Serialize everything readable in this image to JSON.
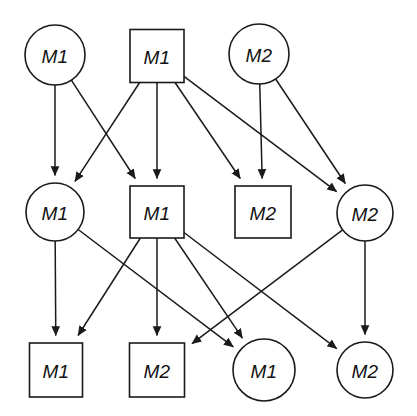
{
  "diagram": {
    "background_color": "#ffffff",
    "stroke_color": "#1a1a1a",
    "fill_color": "#ffffff",
    "width": 417,
    "height": 416,
    "rows": 3,
    "columns": 4,
    "node_shapes": [
      "circle",
      "square"
    ],
    "nodes": [
      {
        "id": "n1",
        "label": "M1",
        "shape": "circle",
        "row": 0,
        "col": 0,
        "cx": 55,
        "cy": 55,
        "r": 30
      },
      {
        "id": "n2",
        "label": "M1",
        "shape": "square",
        "row": 0,
        "col": 1,
        "cx": 157,
        "cy": 56,
        "w": 54,
        "h": 53
      },
      {
        "id": "n3",
        "label": "M2",
        "shape": "circle",
        "row": 0,
        "col": 2,
        "cx": 259,
        "cy": 54,
        "r": 30
      },
      {
        "id": "n4",
        "label": "M1",
        "shape": "circle",
        "row": 1,
        "col": 0,
        "cx": 55,
        "cy": 212,
        "r": 29
      },
      {
        "id": "n5",
        "label": "M1",
        "shape": "square",
        "row": 1,
        "col": 1,
        "cx": 157,
        "cy": 212,
        "w": 54,
        "h": 52
      },
      {
        "id": "n6",
        "label": "M2",
        "shape": "square",
        "row": 1,
        "col": 2,
        "cx": 263,
        "cy": 212,
        "w": 56,
        "h": 52
      },
      {
        "id": "n7",
        "label": "M2",
        "shape": "circle",
        "row": 1,
        "col": 3,
        "cx": 365,
        "cy": 213,
        "r": 28
      },
      {
        "id": "n8",
        "label": "M1",
        "shape": "square",
        "row": 2,
        "col": 0,
        "cx": 56,
        "cy": 370,
        "w": 53,
        "h": 54
      },
      {
        "id": "n9",
        "label": "M2",
        "shape": "square",
        "row": 2,
        "col": 1,
        "cx": 157,
        "cy": 370,
        "w": 55,
        "h": 54
      },
      {
        "id": "n10",
        "label": "M1",
        "shape": "circle",
        "row": 2,
        "col": 2,
        "cx": 264,
        "cy": 370,
        "r": 31
      },
      {
        "id": "n11",
        "label": "M2",
        "shape": "circle",
        "row": 2,
        "col": 3,
        "cx": 365,
        "cy": 370,
        "r": 28
      }
    ],
    "edges": [
      {
        "from": "n1",
        "to": "n4",
        "directed": true
      },
      {
        "from": "n1",
        "to": "n5",
        "directed": true
      },
      {
        "from": "n2",
        "to": "n4",
        "directed": true
      },
      {
        "from": "n2",
        "to": "n5",
        "directed": true
      },
      {
        "from": "n2",
        "to": "n6",
        "directed": true
      },
      {
        "from": "n2",
        "to": "n7",
        "directed": true
      },
      {
        "from": "n3",
        "to": "n6",
        "directed": true
      },
      {
        "from": "n3",
        "to": "n7",
        "directed": true
      },
      {
        "from": "n4",
        "to": "n8",
        "directed": true
      },
      {
        "from": "n4",
        "to": "n10",
        "directed": true
      },
      {
        "from": "n5",
        "to": "n8",
        "directed": true
      },
      {
        "from": "n5",
        "to": "n9",
        "directed": true
      },
      {
        "from": "n5",
        "to": "n10",
        "directed": true
      },
      {
        "from": "n5",
        "to": "n11",
        "directed": true
      },
      {
        "from": "n7",
        "to": "n9",
        "directed": true
      },
      {
        "from": "n7",
        "to": "n11",
        "directed": true
      }
    ]
  }
}
